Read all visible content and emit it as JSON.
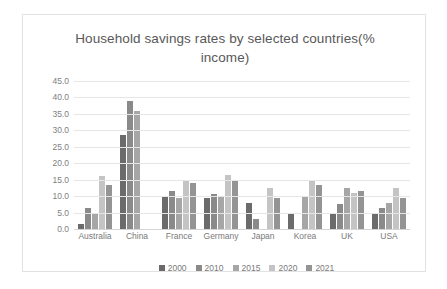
{
  "chart_data": {
    "type": "bar",
    "title": "Household savings rates by selected countries(% income)",
    "xlabel": "",
    "ylabel": "",
    "ylim": [
      0,
      45
    ],
    "ytick_step": 5,
    "ytick_labels": [
      "45.0",
      "40.0",
      "35.0",
      "30.0",
      "25.0",
      "20.0",
      "15.0",
      "10.0",
      "5.0",
      "0.0"
    ],
    "grid": true,
    "legend_position": "bottom",
    "categories": [
      "Australia",
      "China",
      "France",
      "Germany",
      "Japan",
      "Korea",
      "UK",
      "USA"
    ],
    "series": [
      {
        "name": "2000",
        "color": "#6b6b6b",
        "values": [
          1.5,
          28.5,
          10.0,
          9.5,
          8.0,
          4.5,
          5.0,
          5.0
        ]
      },
      {
        "name": "2010",
        "color": "#8a8a8a",
        "values": [
          6.5,
          39.0,
          11.5,
          10.5,
          3.0,
          0.0,
          7.5,
          6.5
        ]
      },
      {
        "name": "2015",
        "color": "#a6a6a6",
        "values": [
          5.0,
          36.0,
          9.5,
          10.0,
          0.0,
          10.0,
          12.5,
          8.0
        ]
      },
      {
        "name": "2020",
        "color": "#c4c4c4",
        "values": [
          16.0,
          0.0,
          15.0,
          16.5,
          12.5,
          15.0,
          11.0,
          12.5
        ]
      },
      {
        "name": "2021",
        "color": "#949494",
        "values": [
          13.5,
          0.0,
          14.0,
          15.0,
          9.5,
          13.5,
          11.5,
          9.5
        ]
      }
    ]
  },
  "colors": {
    "frame_border": "#e2e2e2",
    "gridline": "#e6e6e6",
    "title_text": "#585858",
    "tick_text": "#808080"
  }
}
